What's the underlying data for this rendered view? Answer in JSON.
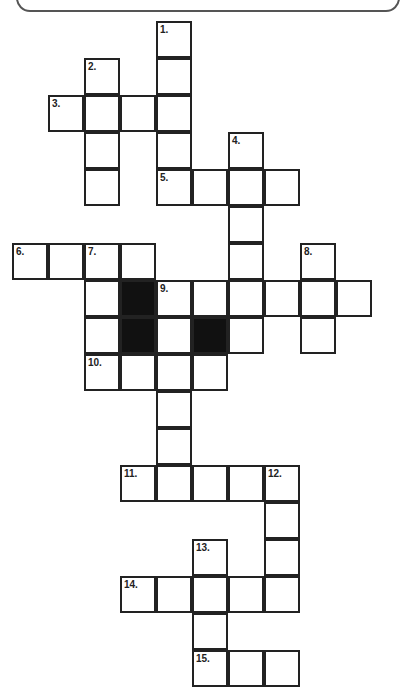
{
  "puzzle": {
    "type": "crossword",
    "title": "",
    "clue_numbers": [
      "1.",
      "2.",
      "3.",
      "4.",
      "5.",
      "6.",
      "7.",
      "8.",
      "9.",
      "10.",
      "11.",
      "12.",
      "13.",
      "14.",
      "15."
    ],
    "cells": [
      {
        "r": 0,
        "c": 4,
        "n": "1."
      },
      {
        "r": 1,
        "c": 2,
        "n": "2."
      },
      {
        "r": 1,
        "c": 4
      },
      {
        "r": 2,
        "c": 1,
        "n": "3."
      },
      {
        "r": 2,
        "c": 2
      },
      {
        "r": 2,
        "c": 3
      },
      {
        "r": 2,
        "c": 4
      },
      {
        "r": 3,
        "c": 2
      },
      {
        "r": 3,
        "c": 4
      },
      {
        "r": 3,
        "c": 6,
        "n": "4."
      },
      {
        "r": 4,
        "c": 2
      },
      {
        "r": 4,
        "c": 4,
        "n": "5."
      },
      {
        "r": 4,
        "c": 5
      },
      {
        "r": 4,
        "c": 6
      },
      {
        "r": 4,
        "c": 7
      },
      {
        "r": 5,
        "c": 6
      },
      {
        "r": 6,
        "c": 0,
        "n": "6."
      },
      {
        "r": 6,
        "c": 1
      },
      {
        "r": 6,
        "c": 2,
        "n": "7."
      },
      {
        "r": 6,
        "c": 3
      },
      {
        "r": 6,
        "c": 6
      },
      {
        "r": 6,
        "c": 8,
        "n": "8."
      },
      {
        "r": 7,
        "c": 2
      },
      {
        "r": 7,
        "c": 3,
        "black": true
      },
      {
        "r": 7,
        "c": 4,
        "n": "9."
      },
      {
        "r": 7,
        "c": 5
      },
      {
        "r": 7,
        "c": 6
      },
      {
        "r": 7,
        "c": 7
      },
      {
        "r": 7,
        "c": 8
      },
      {
        "r": 7,
        "c": 9
      },
      {
        "r": 8,
        "c": 2
      },
      {
        "r": 8,
        "c": 3,
        "black": true
      },
      {
        "r": 8,
        "c": 4
      },
      {
        "r": 8,
        "c": 5,
        "black": true
      },
      {
        "r": 8,
        "c": 6
      },
      {
        "r": 8,
        "c": 8
      },
      {
        "r": 9,
        "c": 2,
        "n": "10."
      },
      {
        "r": 9,
        "c": 3
      },
      {
        "r": 9,
        "c": 4
      },
      {
        "r": 9,
        "c": 5
      },
      {
        "r": 10,
        "c": 4
      },
      {
        "r": 11,
        "c": 4
      },
      {
        "r": 12,
        "c": 3,
        "n": "11."
      },
      {
        "r": 12,
        "c": 4
      },
      {
        "r": 12,
        "c": 5
      },
      {
        "r": 12,
        "c": 6
      },
      {
        "r": 12,
        "c": 7,
        "n": "12."
      },
      {
        "r": 13,
        "c": 7
      },
      {
        "r": 14,
        "c": 5,
        "n": "13."
      },
      {
        "r": 14,
        "c": 7
      },
      {
        "r": 15,
        "c": 3,
        "n": "14."
      },
      {
        "r": 15,
        "c": 4
      },
      {
        "r": 15,
        "c": 5
      },
      {
        "r": 15,
        "c": 6
      },
      {
        "r": 15,
        "c": 7
      },
      {
        "r": 16,
        "c": 5
      },
      {
        "r": 17,
        "c": 5,
        "n": "15."
      },
      {
        "r": 17,
        "c": 6
      },
      {
        "r": 17,
        "c": 7
      }
    ]
  }
}
